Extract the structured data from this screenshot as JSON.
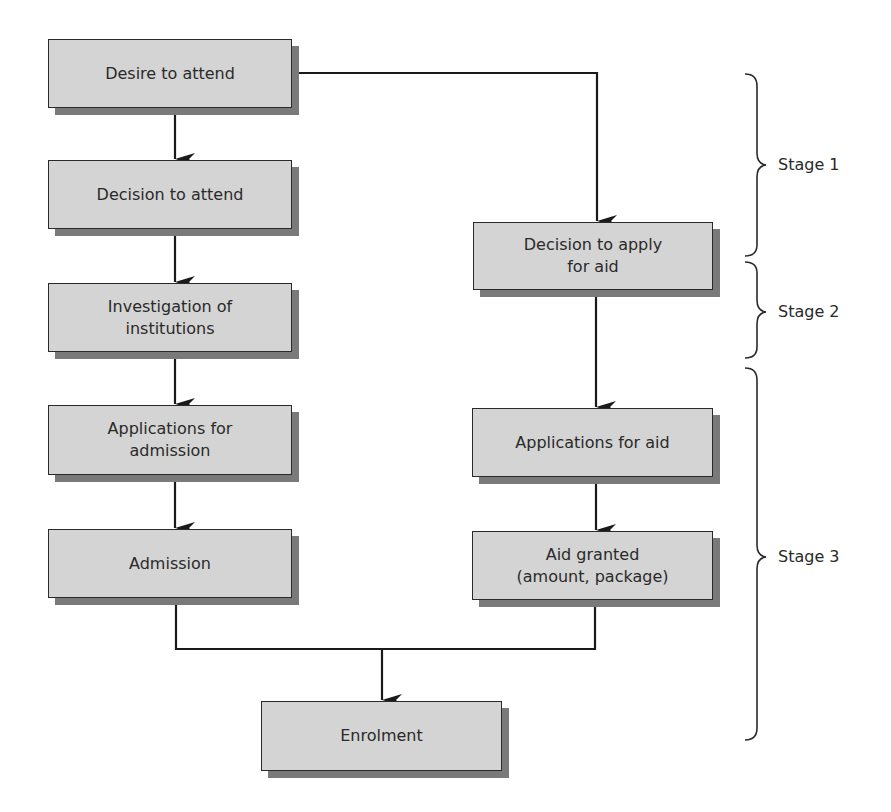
{
  "figure": {
    "left_column": [
      {
        "id": "desire",
        "label": "Desire to attend"
      },
      {
        "id": "decision",
        "label": "Decision to attend"
      },
      {
        "id": "investigation",
        "label": "Investigation of\ninstitutions"
      },
      {
        "id": "applications-admission",
        "label": "Applications for\nadmission"
      },
      {
        "id": "admission",
        "label": "Admission"
      }
    ],
    "right_column": [
      {
        "id": "decision-aid",
        "label": "Decision to apply\nfor aid"
      },
      {
        "id": "applications-aid",
        "label": "Applications for aid"
      },
      {
        "id": "aid-granted",
        "label": "Aid granted\n(amount, package)"
      }
    ],
    "final": {
      "id": "enrolment",
      "label": "Enrolment"
    },
    "stages": [
      {
        "label": "Stage 1"
      },
      {
        "label": "Stage 2"
      },
      {
        "label": "Stage 3"
      }
    ]
  },
  "colors": {
    "box_fill": "#d4d4d4",
    "box_shadow": "#7a7a7a",
    "line": "#1a1a1a",
    "text": "#2a2a2a"
  }
}
